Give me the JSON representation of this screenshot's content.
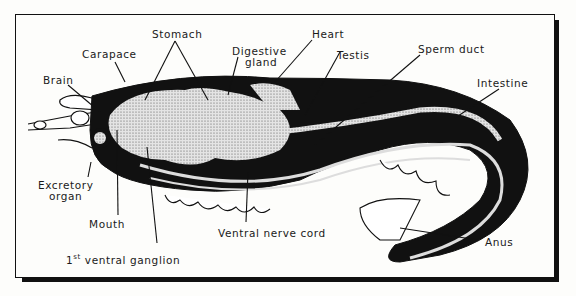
{
  "diagram": {
    "labels": {
      "stomach": "Stomach",
      "heart": "Heart",
      "carapace": "Carapace",
      "digestive_gland_1": "Digestive",
      "digestive_gland_2": "gland",
      "testis": "Testis",
      "sperm_duct": "Sperm duct",
      "brain": "Brain",
      "intestine": "Intestine",
      "excretory_organ_1": "Excretory",
      "excretory_organ_2": "organ",
      "mouth": "Mouth",
      "ventral_nerve_cord": "Ventral nerve cord",
      "first_ventral_ganglion_prefix": "1",
      "first_ventral_ganglion_sup": "st",
      "first_ventral_ganglion_rest": " ventral ganglion",
      "anus": "Anus"
    },
    "colors": {
      "ink": "#111111",
      "paper": "#fdfdfb",
      "stipple": "#bdbdbd"
    }
  }
}
